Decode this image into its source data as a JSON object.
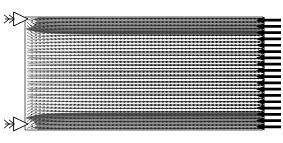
{
  "figure": {
    "title": "",
    "type": "vector-field",
    "width": 283,
    "height": 143,
    "background_color": "#ffffff",
    "line_color": "#000000",
    "vector_color": "#4a4a4a",
    "boundary_color": "#555555"
  },
  "domain": {
    "label": "rectangular-flow-domain",
    "x0": 25,
    "y0": 17,
    "x1": 263,
    "y1": 130,
    "shape": "rectangle"
  },
  "inlets": [
    {
      "name": "inlet-top-left",
      "style": "hollow-arrow",
      "direction": "right",
      "x": 4,
      "y": 12,
      "width": 24,
      "height": 14,
      "label": ""
    },
    {
      "name": "inlet-bottom-left",
      "style": "hollow-arrow",
      "direction": "right",
      "x": 4,
      "y": 117,
      "width": 24,
      "height": 14,
      "label": ""
    }
  ],
  "outlet": {
    "name": "outlet-right-edge",
    "style": "solid-arrow-array",
    "direction": "left",
    "count": 18,
    "x_tip": 256,
    "x_tail": 281,
    "y_start": 17,
    "y_end": 130,
    "label": ""
  },
  "chart_data": {
    "type": "scatter",
    "title": "",
    "xlabel": "",
    "ylabel": "",
    "grid": true,
    "legend": null,
    "xlim": [
      0,
      1
    ],
    "ylim": [
      0,
      1
    ],
    "field": {
      "grid_columns": 62,
      "grid_rows": 34,
      "sources": [
        {
          "name": "source-top",
          "x": 0.0,
          "y": 1.0,
          "strength": 1.0
        },
        {
          "name": "source-bottom",
          "x": 0.0,
          "y": 0.0,
          "strength": 1.0
        }
      ],
      "sink": {
        "name": "sink-right-edge",
        "x": 1.0,
        "uniform": true
      },
      "max_magnitude": 1.0,
      "min_magnitude": 0.08
    }
  }
}
